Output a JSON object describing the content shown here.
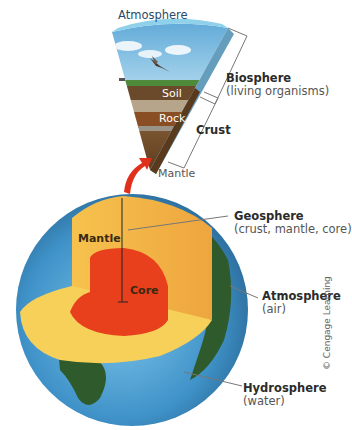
{
  "diagram": {
    "wedge": {
      "layers": [
        {
          "name": "Atmosphere",
          "label": "Atmosphere"
        },
        {
          "name": "Soil",
          "label": "Soil"
        },
        {
          "name": "Rock",
          "label": "Rock"
        }
      ],
      "bottom_label": "Mantle"
    },
    "brackets": {
      "biosphere": {
        "title": "Biosphere",
        "subtitle": "(living organisms)"
      },
      "crust": {
        "title": "Crust"
      }
    },
    "globe": {
      "mantle_label": "Mantle",
      "core_label": "Core"
    },
    "callouts": {
      "geosphere": {
        "title": "Geosphere",
        "subtitle": "(crust, mantle, core)"
      },
      "atmosphere": {
        "title": "Atmosphere",
        "subtitle": "(air)"
      },
      "hydrosphere": {
        "title": "Hydrosphere",
        "subtitle": "(water)"
      }
    },
    "credit": "© Cengage Learning",
    "colors": {
      "ocean": "#4a9fd0",
      "land": "#2f5a2c",
      "mantle": "#f4b34a",
      "mantle_floor": "#f7d05a",
      "core": "#e8401c",
      "arrow": "#e0301c",
      "sky": "#7fbde0",
      "soil": "#6b4a2c",
      "rock": "#8a5a30"
    }
  }
}
